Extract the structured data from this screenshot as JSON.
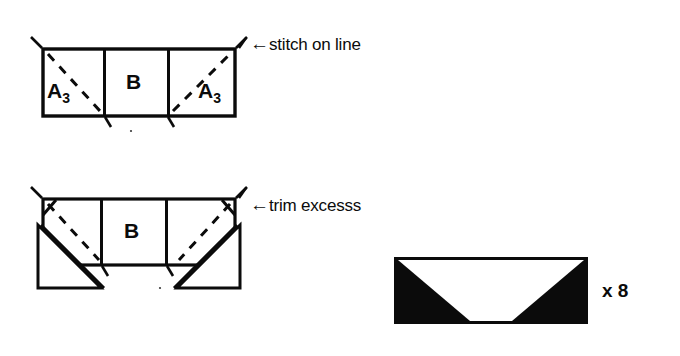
{
  "document": {
    "kind": "sewing-instruction-diagram",
    "background_color": "#ffffff",
    "ink_color": "#0b0b0b"
  },
  "figures": [
    {
      "id": "figure-1-stitch",
      "name": "unit-before-trim",
      "piece_labels": [
        {
          "base": "A",
          "subscript": "3"
        },
        {
          "base": "B",
          "subscript": ""
        },
        {
          "base": "A",
          "subscript": "3"
        }
      ],
      "annotation": {
        "arrow": "←",
        "text": "stitch on line"
      }
    },
    {
      "id": "figure-2-trim",
      "name": "unit-folded-open",
      "piece_labels": [
        {
          "base": "B",
          "subscript": ""
        }
      ],
      "annotation": {
        "arrow": "←",
        "text": "trim excesss"
      }
    },
    {
      "id": "figure-3-finished",
      "name": "finished-flying-geese-unit",
      "fill_color": "#0b0b0b",
      "inner_color": "#ffffff",
      "quantity_label": "x 8"
    }
  ]
}
